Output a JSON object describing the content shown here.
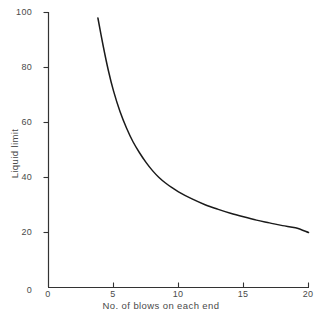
{
  "chart_data": {
    "type": "line",
    "title": "",
    "xlabel": "No. of blows on each end",
    "ylabel": "Liquid limit",
    "xlim": [
      0,
      20
    ],
    "ylim": [
      0,
      100
    ],
    "xticks": [
      0,
      5,
      10,
      15,
      20
    ],
    "xtick_labels": [
      "0",
      "5",
      "10",
      "15",
      "20"
    ],
    "yticks": [
      0,
      20,
      40,
      60,
      80,
      100
    ],
    "ytick_labels": [
      "0",
      "20",
      "40",
      "60",
      "80",
      "100"
    ],
    "grid": false,
    "legend": false,
    "series": [
      {
        "name": "Flow curve",
        "color": "#1a1a1a",
        "x": [
          3.8,
          4.2,
          4.6,
          5.0,
          5.5,
          6.0,
          6.5,
          7.0,
          7.5,
          8.0,
          8.5,
          9.0,
          9.5,
          10.0,
          11.0,
          12.0,
          13.0,
          14.0,
          15.0,
          16.0,
          17.0,
          18.0,
          19.0,
          20.0
        ],
        "y": [
          98.0,
          88.0,
          79.0,
          71.5,
          64.0,
          58.0,
          53.0,
          49.0,
          45.5,
          42.5,
          40.0,
          38.0,
          36.3,
          34.8,
          32.3,
          30.2,
          28.5,
          27.0,
          25.7,
          24.5,
          23.5,
          22.5,
          21.7,
          20.0
        ]
      }
    ]
  },
  "axes": {
    "line_color": "#333333",
    "tick_length_px": 5
  }
}
